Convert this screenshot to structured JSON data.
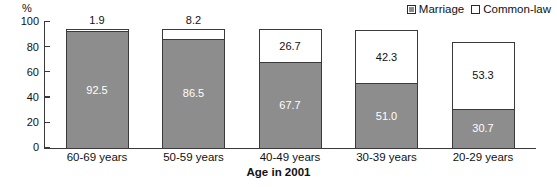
{
  "chart_data": {
    "type": "bar",
    "subtype": "stacked-vertical-100",
    "title": "",
    "xlabel": "Age in 2001",
    "ylabel": "%",
    "ylim": [
      0,
      100
    ],
    "yticks": [
      0,
      20,
      40,
      60,
      80,
      100
    ],
    "ytick_labels": [
      "0",
      "20",
      "40",
      "60",
      "80",
      "100"
    ],
    "grid": false,
    "legend_position": "top-right",
    "categories": [
      "60-69 years",
      "50-59 years",
      "40-49 years",
      "30-39 years",
      "20-29 years"
    ],
    "series": [
      {
        "name": "Marriage",
        "color": "#8d8d8d",
        "values": [
          92.5,
          86.5,
          67.7,
          51.0,
          30.7
        ],
        "labels": [
          "92.5",
          "86.5",
          "67.7",
          "51.0",
          "30.7"
        ]
      },
      {
        "name": "Common-law",
        "color": "#ffffff",
        "values": [
          1.9,
          8.2,
          26.7,
          42.3,
          53.3
        ],
        "labels": [
          "1.9",
          "8.2",
          "26.7",
          "42.3",
          "53.3"
        ]
      }
    ]
  },
  "legend": {
    "entries": [
      {
        "label": "Marriage",
        "swatch": "filled-square-icon"
      },
      {
        "label": "Common-law",
        "swatch": "hollow-square-icon"
      }
    ]
  },
  "axes": {
    "y_unit_label": "%",
    "x_title": "Age in 2001"
  }
}
